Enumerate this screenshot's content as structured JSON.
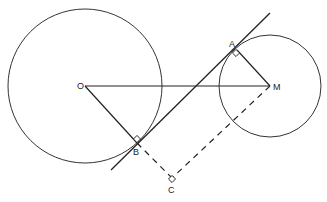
{
  "diagram": {
    "type": "geometry",
    "colors": {
      "stroke": "#333333",
      "background": "#ffffff"
    },
    "points": {
      "O": {
        "label": "O",
        "x": 85,
        "y": 86
      },
      "M": {
        "label": "M",
        "x": 270,
        "y": 86
      },
      "A": {
        "label": "A",
        "x": 237,
        "y": 50
      },
      "B": {
        "label": "B",
        "x": 137,
        "y": 143
      },
      "C": {
        "label": "C",
        "x": 172,
        "y": 178
      }
    },
    "circles": [
      {
        "name": "circle-O",
        "center": "O",
        "r": 77
      },
      {
        "name": "circle-M",
        "center": "M",
        "r": 51
      }
    ],
    "segments": [
      {
        "name": "segment-OM",
        "from": "O",
        "to": "M",
        "style": "solid"
      },
      {
        "name": "segment-OB",
        "from": "O",
        "to": "B",
        "style": "solid"
      },
      {
        "name": "segment-MA",
        "from": "M",
        "to": "A",
        "style": "solid"
      },
      {
        "name": "segment-BC",
        "from": "B",
        "to": "C",
        "style": "dashed"
      },
      {
        "name": "segment-MC",
        "from": "M",
        "to": "C",
        "style": "dashed"
      }
    ],
    "tangent_line": {
      "x1": 111,
      "y1": 170,
      "x2": 270,
      "y2": 13
    },
    "right_angles": [
      "A",
      "B",
      "C"
    ]
  }
}
